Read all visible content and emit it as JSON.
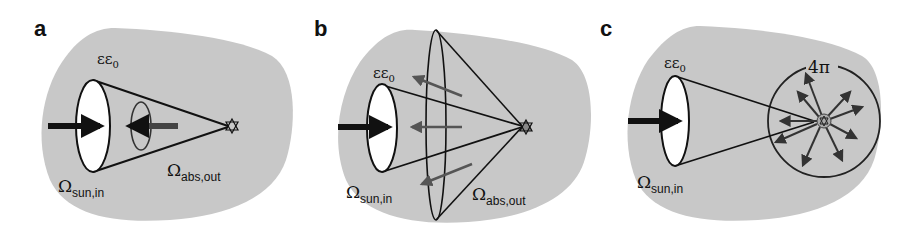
{
  "figure": {
    "background_blob_color": "#c8c8c8",
    "line_color": "#111111",
    "arrow_gray": "#555555",
    "panels": [
      {
        "id": "a",
        "label": "a",
        "epsilon_label": "εε",
        "epsilon_sub": "0",
        "omega_in": "Ω",
        "omega_in_sub": "sun,in",
        "omega_out": "Ω",
        "omega_out_sub": "abs,out",
        "description": "Narrow emission cone: absorber emits only into the solid angle of the sun"
      },
      {
        "id": "b",
        "label": "b",
        "epsilon_label": "εε",
        "epsilon_sub": "0",
        "omega_in": "Ω",
        "omega_in_sub": "sun,in",
        "omega_out": "Ω",
        "omega_out_sub": "abs,out",
        "description": "Wide emission cone: absorber emits into a larger solid angle"
      },
      {
        "id": "c",
        "label": "c",
        "epsilon_label": "εε",
        "epsilon_sub": "0",
        "omega_in": "Ω",
        "omega_in_sub": "sun,in",
        "solid_angle_label": "4π",
        "description": "Isotropic emission into full 4π solid angle"
      }
    ]
  }
}
